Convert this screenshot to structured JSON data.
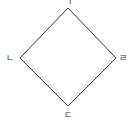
{
  "diagram": {
    "type": "diamond",
    "stroke_color": "#333333",
    "stroke_width": 1,
    "vertices": [
      {
        "id": "top",
        "label": "ㄱ",
        "x": 68,
        "y": 8,
        "label_x": 68,
        "label_y": 5
      },
      {
        "id": "right",
        "label": "ㄹ",
        "x": 116,
        "y": 58,
        "label_x": 123,
        "label_y": 61
      },
      {
        "id": "bottom",
        "label": "ㄷ",
        "x": 68,
        "y": 106,
        "label_x": 68,
        "label_y": 118
      },
      {
        "id": "left",
        "label": "ㄴ",
        "x": 20,
        "y": 58,
        "label_x": 10,
        "label_y": 61
      }
    ]
  }
}
